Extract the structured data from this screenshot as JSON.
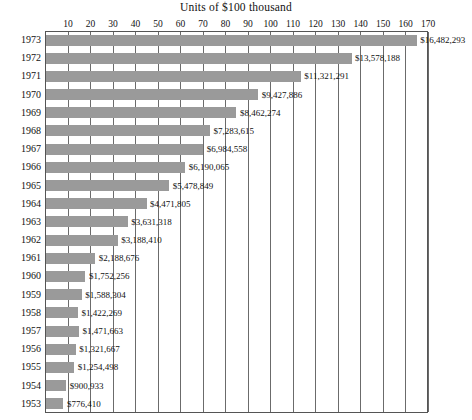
{
  "chart_data": {
    "type": "bar",
    "orientation": "horizontal",
    "title": "Units of $100 thousand",
    "xlabel": "",
    "ylabel": "",
    "xlim": [
      0,
      170
    ],
    "xtick_step": 10,
    "xticks": [
      10,
      20,
      30,
      40,
      50,
      60,
      70,
      80,
      90,
      100,
      110,
      120,
      130,
      140,
      150,
      160,
      170
    ],
    "grid": true,
    "legend": false,
    "unit_value": 100000,
    "bar_color": "#9a9a9a",
    "axis_color": "#555555",
    "categories": [
      "1973",
      "1972",
      "1971",
      "1970",
      "1969",
      "1968",
      "1967",
      "1966",
      "1965",
      "1964",
      "1963",
      "1962",
      "1961",
      "1960",
      "1959",
      "1958",
      "1957",
      "1956",
      "1955",
      "1954",
      "1953"
    ],
    "values": [
      16482293,
      13578188,
      11321291,
      9427886,
      8462274,
      7283615,
      6984558,
      6190065,
      5478849,
      4471805,
      3631318,
      3188410,
      2188676,
      1752256,
      1588304,
      1422269,
      1471663,
      1321667,
      1254498,
      900933,
      776410
    ],
    "data_labels": [
      "$16,482,293",
      "$13,578,188",
      "$11,321,291",
      "$9,427,886",
      "$8,462,274",
      "$7,283,615",
      "$6,984,558",
      "$6,190,065",
      "$5,478,849",
      "$4,471,805",
      "$3,631,318",
      "$3,188,410",
      "$2,188,676",
      "$1,752,256",
      "$1,588,304",
      "$1,422,269",
      "$1,471,663",
      "$1,321,667",
      "$1,254,498",
      "$900,933",
      "$776,410"
    ],
    "rows": [
      {
        "year": "1973",
        "value": 16482293,
        "units": 164.82293,
        "label": "$16,482,293"
      },
      {
        "year": "1972",
        "value": 13578188,
        "units": 135.78188,
        "label": "$13,578,188"
      },
      {
        "year": "1971",
        "value": 11321291,
        "units": 113.21291,
        "label": "$11,321,291"
      },
      {
        "year": "1970",
        "value": 9427886,
        "units": 94.27886,
        "label": "$9,427,886"
      },
      {
        "year": "1969",
        "value": 8462274,
        "units": 84.62274,
        "label": "$8,462,274"
      },
      {
        "year": "1968",
        "value": 7283615,
        "units": 72.83615,
        "label": "$7,283,615"
      },
      {
        "year": "1967",
        "value": 6984558,
        "units": 69.84558,
        "label": "$6,984,558"
      },
      {
        "year": "1966",
        "value": 6190065,
        "units": 61.90065,
        "label": "$6,190,065"
      },
      {
        "year": "1965",
        "value": 5478849,
        "units": 54.78849,
        "label": "$5,478,849"
      },
      {
        "year": "1964",
        "value": 4471805,
        "units": 44.71805,
        "label": "$4,471,805"
      },
      {
        "year": "1963",
        "value": 3631318,
        "units": 36.31318,
        "label": "$3,631,318"
      },
      {
        "year": "1962",
        "value": 3188410,
        "units": 31.8841,
        "label": "$3,188,410"
      },
      {
        "year": "1961",
        "value": 2188676,
        "units": 21.88676,
        "label": "$2,188,676"
      },
      {
        "year": "1960",
        "value": 1752256,
        "units": 17.52256,
        "label": "$1,752,256"
      },
      {
        "year": "1959",
        "value": 1588304,
        "units": 15.88304,
        "label": "$1,588,304"
      },
      {
        "year": "1958",
        "value": 1422269,
        "units": 14.22269,
        "label": "$1,422,269"
      },
      {
        "year": "1957",
        "value": 1471663,
        "units": 14.71663,
        "label": "$1,471,663"
      },
      {
        "year": "1956",
        "value": 1321667,
        "units": 13.21667,
        "label": "$1,321,667"
      },
      {
        "year": "1955",
        "value": 1254498,
        "units": 12.54498,
        "label": "$1,254,498"
      },
      {
        "year": "1954",
        "value": 900933,
        "units": 9.00933,
        "label": "$900,933"
      },
      {
        "year": "1953",
        "value": 776410,
        "units": 7.7641,
        "label": "$776,410"
      }
    ]
  }
}
